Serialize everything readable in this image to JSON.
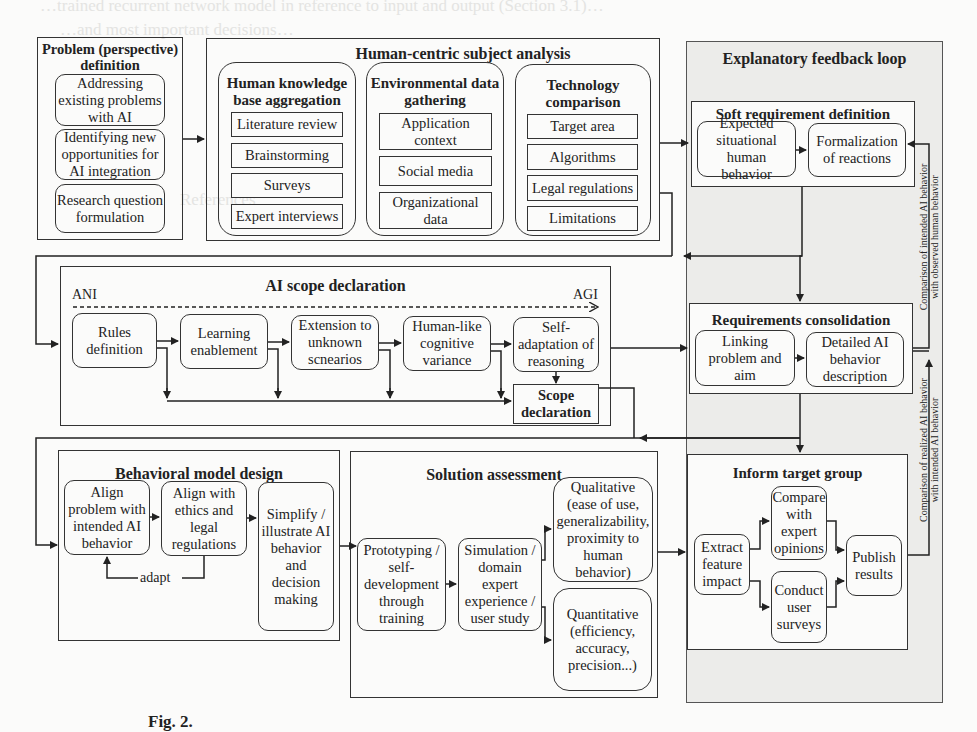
{
  "ghost_text": {
    "line1": "…trained recurrent network model in reference to input and output (Section 3.1)…",
    "line2": "…and most important decisions…",
    "references_heading": "References"
  },
  "problem": {
    "title": "Problem (perspective) definition",
    "items": [
      "Addressing existing problems with AI",
      "Identifying new opportunities for AI integration",
      "Research question formulation"
    ]
  },
  "subject_analysis": {
    "title": "Human-centric subject analysis",
    "groups": [
      {
        "title": "Human knowledge base aggregation",
        "items": [
          "Literature review",
          "Brainstorming",
          "Surveys",
          "Expert interviews"
        ]
      },
      {
        "title": "Environmental data gathering",
        "items": [
          "Application context",
          "Social media",
          "Organizational data"
        ]
      },
      {
        "title": "Technology comparison",
        "items": [
          "Target area",
          "Algorithms",
          "Legal regulations",
          "Limitations"
        ]
      }
    ]
  },
  "feedback_loop": {
    "title": "Explanatory feedback loop",
    "soft_requirement": {
      "title": "Soft requirement definition",
      "items": [
        "Expected situational human behavior",
        "Formalization of reactions"
      ]
    },
    "requirements_consolidation": {
      "title": "Requirements consolidation",
      "items": [
        "Linking problem and aim",
        "Detailed AI behavior description"
      ]
    },
    "inform_target_group": {
      "title": "Inform target group",
      "items": [
        "Extract feature impact",
        "Compare with expert opinions",
        "Conduct user surveys",
        "Publish results"
      ]
    },
    "side_labels": {
      "upper_line1": "Comparison of intended AI behavior",
      "upper_line2": "with observed human behavior",
      "lower_line1": "Comparison of realized AI behavior",
      "lower_line2": "with intended AI behavior"
    }
  },
  "ai_scope": {
    "title": "AI scope declaration",
    "axis_start": "ANI",
    "axis_end": "AGI",
    "steps": [
      "Rules definition",
      "Learning enablement",
      "Extension to unknown scnearios",
      "Human-like cognitive variance",
      "Self-adaptation of reasoning"
    ],
    "result": "Scope declaration"
  },
  "behavioral_model": {
    "title": "Behavioral model design",
    "steps": [
      "Align problem with intended AI behavior",
      "Align with ethics and legal regulations",
      "Simplify / illustrate AI behavior and decision making"
    ],
    "loop_label": "adapt"
  },
  "solution_assessment": {
    "title": "Solution assessment",
    "steps": [
      "Prototyping / self-development through training",
      "Simulation / domain expert experience / user study"
    ],
    "outcomes": [
      "Qualitative (ease of use, generalizability, proximity to human behavior)",
      "Quantitative (efficiency, accuracy, precision...)"
    ]
  },
  "caption": "Fig. 2."
}
